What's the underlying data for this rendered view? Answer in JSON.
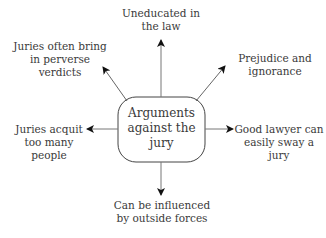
{
  "diagram": {
    "type": "spider-diagram",
    "colors": {
      "line": "#555555",
      "arrowhead": "#111111",
      "text": "#3a3a3a",
      "box_border": "#444444",
      "background": "#ffffff"
    },
    "center": {
      "label": "Arguments\nagainst the\njury"
    },
    "nodes": [
      {
        "id": "top",
        "label": "Uneducated in\nthe law"
      },
      {
        "id": "top-left",
        "label": "Juries often bring\nin perverse\nverdicts"
      },
      {
        "id": "top-right",
        "label": "Prejudice and\nignorance"
      },
      {
        "id": "left",
        "label": "Juries acquit\ntoo many\npeople"
      },
      {
        "id": "right",
        "label": "Good lawyer can\neasily sway a jury"
      },
      {
        "id": "bottom",
        "label": "Can be influenced\nby outside forces"
      }
    ]
  }
}
